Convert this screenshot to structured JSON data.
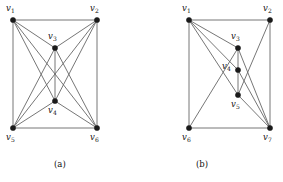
{
  "figure": {
    "width": 283,
    "height": 182,
    "background_color": "#ffffff",
    "edge_color": "#666666",
    "vertex_color": "#1a1a1a",
    "label_color": "#111111"
  },
  "panels": [
    {
      "id": "panel-a",
      "caption": "(a)",
      "caption_pos": {
        "x": 54,
        "y": 159
      },
      "vertices": [
        {
          "id": "v1",
          "label": "v",
          "sub": "1",
          "x": 13,
          "y": 20,
          "label_x": 6,
          "label_y": 4
        },
        {
          "id": "v2",
          "label": "v",
          "sub": "2",
          "x": 97,
          "y": 20,
          "label_x": 90,
          "label_y": 4
        },
        {
          "id": "v3",
          "label": "v",
          "sub": "3",
          "x": 55,
          "y": 48,
          "label_x": 48,
          "label_y": 32
        },
        {
          "id": "v4",
          "label": "v",
          "sub": "4",
          "x": 55,
          "y": 101,
          "label_x": 48,
          "label_y": 106
        },
        {
          "id": "v5",
          "label": "v",
          "sub": "5",
          "x": 13,
          "y": 128,
          "label_x": 6,
          "label_y": 133
        },
        {
          "id": "v6",
          "label": "v",
          "sub": "6",
          "x": 97,
          "y": 128,
          "label_x": 90,
          "label_y": 133
        }
      ],
      "edges": [
        [
          "v1",
          "v2"
        ],
        [
          "v1",
          "v5"
        ],
        [
          "v2",
          "v6"
        ],
        [
          "v5",
          "v6"
        ],
        [
          "v1",
          "v3"
        ],
        [
          "v1",
          "v4"
        ],
        [
          "v1",
          "v6"
        ],
        [
          "v2",
          "v3"
        ],
        [
          "v2",
          "v4"
        ],
        [
          "v2",
          "v5"
        ],
        [
          "v3",
          "v4"
        ],
        [
          "v3",
          "v5"
        ],
        [
          "v3",
          "v6"
        ],
        [
          "v4",
          "v5"
        ],
        [
          "v4",
          "v6"
        ]
      ]
    },
    {
      "id": "panel-b",
      "caption": "(b)",
      "caption_pos": {
        "x": 196,
        "y": 159
      },
      "vertices": [
        {
          "id": "v1",
          "label": "v",
          "sub": "1",
          "x": 189,
          "y": 20,
          "label_x": 182,
          "label_y": 4
        },
        {
          "id": "v2",
          "label": "v",
          "sub": "2",
          "x": 270,
          "y": 20,
          "label_x": 263,
          "label_y": 4
        },
        {
          "id": "v3",
          "label": "v",
          "sub": "3",
          "x": 238,
          "y": 48,
          "label_x": 231,
          "label_y": 32
        },
        {
          "id": "v4",
          "label": "v",
          "sub": "4",
          "x": 238,
          "y": 70,
          "label_x": 222,
          "label_y": 62
        },
        {
          "id": "v5",
          "label": "v",
          "sub": "5",
          "x": 238,
          "y": 95,
          "label_x": 231,
          "label_y": 100
        },
        {
          "id": "v6",
          "label": "v",
          "sub": "6",
          "x": 189,
          "y": 128,
          "label_x": 182,
          "label_y": 133
        },
        {
          "id": "v7",
          "label": "v",
          "sub": "7",
          "x": 270,
          "y": 128,
          "label_x": 263,
          "label_y": 133
        }
      ],
      "edges": [
        [
          "v1",
          "v2"
        ],
        [
          "v1",
          "v6"
        ],
        [
          "v2",
          "v7"
        ],
        [
          "v6",
          "v7"
        ],
        [
          "v1",
          "v3"
        ],
        [
          "v1",
          "v4"
        ],
        [
          "v1",
          "v5"
        ],
        [
          "v2",
          "v5"
        ],
        [
          "v3",
          "v4"
        ],
        [
          "v3",
          "v7"
        ],
        [
          "v4",
          "v5"
        ],
        [
          "v4",
          "v7"
        ],
        [
          "v5",
          "v7"
        ],
        [
          "v6",
          "v3"
        ]
      ]
    }
  ]
}
